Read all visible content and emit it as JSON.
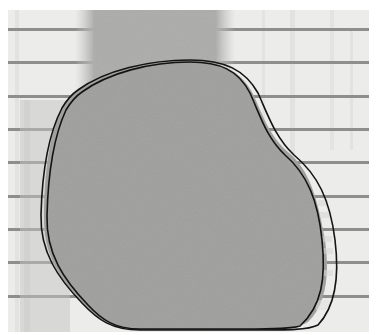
{
  "image": {
    "description": "Grayscale photograph of an irregular gray blob over a horizontally striped background, traced with two black outline contours",
    "colors": {
      "background": "#ffffff",
      "paper": "#ececea",
      "stripe": "#8e8e8e",
      "blob": "#a4a4a2",
      "column": "#b4b4b2",
      "outline": "#141414"
    },
    "stripe_rows_y": [
      30,
      63,
      97,
      130,
      163,
      197,
      230,
      263,
      297
    ]
  }
}
